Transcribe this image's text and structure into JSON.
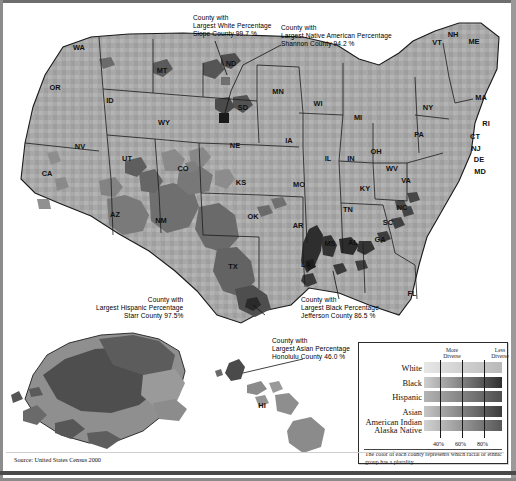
{
  "figure": {
    "source": "Source: United States Census 2000"
  },
  "callouts": [
    {
      "id": "white",
      "line1": "County with",
      "line2": "Largest White Percentage",
      "line3": "Slope County  99.7 %",
      "county": "Slope County",
      "value": "99.7 %",
      "group": "White"
    },
    {
      "id": "native",
      "line1": "County with",
      "line2": "Largest Native American Percentage",
      "line3": "Shannon County  94.2 %",
      "county": "Shannon County",
      "value": "94.2 %",
      "group": "Native American"
    },
    {
      "id": "hispanic",
      "line1": "County with",
      "line2": "Largest Hispanic Percentage",
      "line3": "Starr County  97.5%",
      "county": "Starr County",
      "value": "97.5%",
      "group": "Hispanic"
    },
    {
      "id": "black",
      "line1": "County with",
      "line2": "Largest Black Percentage",
      "line3": "Jefferson County  86.5 %",
      "county": "Jefferson County",
      "value": "86.5 %",
      "group": "Black"
    },
    {
      "id": "asian",
      "line1": "County with",
      "line2": "Largest Asian Percentage",
      "line3": "Honolulu County  46.0 %",
      "county": "Honolulu County",
      "value": "46.0 %",
      "group": "Asian"
    }
  ],
  "legend": {
    "more_diverse": "More\nDiverse",
    "more_diverse_l1": "More",
    "more_diverse_l2": "Diverse",
    "less_diverse_l1": "Less",
    "less_diverse_l2": "Diverse",
    "rows": [
      {
        "label": "White",
        "light": "#e7e7e7",
        "dark": "#b9b9b9"
      },
      {
        "label": "Black",
        "light": "#cfcfcf",
        "dark": "#2f2f2f"
      },
      {
        "label": "Hispanic",
        "light": "#b4b4b4",
        "dark": "#4f4f4f"
      },
      {
        "label": "Asian",
        "light": "#c6c6c6",
        "dark": "#3c3c3c"
      },
      {
        "label": "American Indian",
        "label2": "Alaska Native",
        "light": "#d2d2d2",
        "dark": "#585858"
      }
    ],
    "scale": [
      "40%",
      "60%",
      "80%"
    ],
    "note": "The color of each county represents which racial or ethnic group has a plurality."
  },
  "state_labels": [
    {
      "abbr": "WA",
      "x": 76,
      "y": 44
    },
    {
      "abbr": "OR",
      "x": 52,
      "y": 84
    },
    {
      "abbr": "CA",
      "x": 44,
      "y": 170
    },
    {
      "abbr": "NV",
      "x": 77,
      "y": 143
    },
    {
      "abbr": "ID",
      "x": 107,
      "y": 97
    },
    {
      "abbr": "MT",
      "x": 159,
      "y": 67
    },
    {
      "abbr": "WY",
      "x": 161,
      "y": 119
    },
    {
      "abbr": "UT",
      "x": 124,
      "y": 155
    },
    {
      "abbr": "AZ",
      "x": 112,
      "y": 211
    },
    {
      "abbr": "NM",
      "x": 158,
      "y": 217
    },
    {
      "abbr": "CO",
      "x": 180,
      "y": 165
    },
    {
      "abbr": "ND",
      "x": 228,
      "y": 60
    },
    {
      "abbr": "SD",
      "x": 240,
      "y": 104
    },
    {
      "abbr": "NE",
      "x": 232,
      "y": 142
    },
    {
      "abbr": "KS",
      "x": 238,
      "y": 179
    },
    {
      "abbr": "OK",
      "x": 250,
      "y": 213
    },
    {
      "abbr": "TX",
      "x": 230,
      "y": 263
    },
    {
      "abbr": "MN",
      "x": 275,
      "y": 88
    },
    {
      "abbr": "IA",
      "x": 286,
      "y": 137
    },
    {
      "abbr": "MO",
      "x": 296,
      "y": 181
    },
    {
      "abbr": "AR",
      "x": 295,
      "y": 222
    },
    {
      "abbr": "LA",
      "x": 303,
      "y": 261
    },
    {
      "abbr": "WI",
      "x": 315,
      "y": 100
    },
    {
      "abbr": "IL",
      "x": 325,
      "y": 155
    },
    {
      "abbr": "MS",
      "x": 327,
      "y": 240
    },
    {
      "abbr": "AL",
      "x": 350,
      "y": 239
    },
    {
      "abbr": "TN",
      "x": 345,
      "y": 206
    },
    {
      "abbr": "KY",
      "x": 362,
      "y": 185
    },
    {
      "abbr": "IN",
      "x": 348,
      "y": 155
    },
    {
      "abbr": "OH",
      "x": 373,
      "y": 148
    },
    {
      "abbr": "MI",
      "x": 355,
      "y": 114
    },
    {
      "abbr": "GA",
      "x": 377,
      "y": 236
    },
    {
      "abbr": "FL",
      "x": 409,
      "y": 290
    },
    {
      "abbr": "SC",
      "x": 385,
      "y": 219
    },
    {
      "abbr": "NC",
      "x": 399,
      "y": 204
    },
    {
      "abbr": "VA",
      "x": 403,
      "y": 177
    },
    {
      "abbr": "WV",
      "x": 389,
      "y": 165
    },
    {
      "abbr": "PA",
      "x": 416,
      "y": 131
    },
    {
      "abbr": "NY",
      "x": 425,
      "y": 104
    },
    {
      "abbr": "NH",
      "x": 450,
      "y": 31
    },
    {
      "abbr": "VT",
      "x": 434,
      "y": 39
    },
    {
      "abbr": "ME",
      "x": 471,
      "y": 38
    },
    {
      "abbr": "MA",
      "x": 478,
      "y": 94
    },
    {
      "abbr": "RI",
      "x": 483,
      "y": 120
    },
    {
      "abbr": "CT",
      "x": 472,
      "y": 133
    },
    {
      "abbr": "NJ",
      "x": 473,
      "y": 145
    },
    {
      "abbr": "DE",
      "x": 476,
      "y": 156
    },
    {
      "abbr": "MD",
      "x": 477,
      "y": 168
    },
    {
      "abbr": "HI",
      "x": 259,
      "y": 402
    }
  ]
}
